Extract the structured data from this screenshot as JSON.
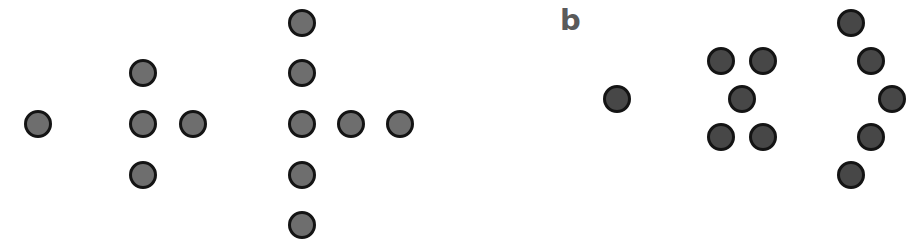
{
  "figure": {
    "panels": [
      {
        "id": "a",
        "label": "a",
        "label_visible": false,
        "dot_fill": "#6e6e6e",
        "dot_border": "#141414",
        "groups": [
          {
            "name": "group-1-dot",
            "count": 1,
            "dots": [
              [
                38,
                124
              ]
            ]
          },
          {
            "name": "group-4-dots",
            "count": 4,
            "dots": [
              [
                143,
                73
              ],
              [
                143,
                124
              ],
              [
                193,
                124
              ],
              [
                143,
                175
              ]
            ]
          },
          {
            "name": "group-7-dots",
            "count": 7,
            "dots": [
              [
                302,
                23
              ],
              [
                302,
                73
              ],
              [
                302,
                124
              ],
              [
                351,
                124
              ],
              [
                400,
                124
              ],
              [
                302,
                175
              ],
              [
                302,
                225
              ]
            ]
          }
        ]
      },
      {
        "id": "b",
        "label": "b",
        "label_visible": true,
        "dot_fill": "#474747",
        "dot_border": "#141414",
        "groups": [
          {
            "name": "group-1-dot",
            "count": 1,
            "dots": [
              [
                617,
                99
              ]
            ]
          },
          {
            "name": "group-5-dots",
            "count": 5,
            "dots": [
              [
                721,
                61
              ],
              [
                763,
                61
              ],
              [
                742,
                99
              ],
              [
                721,
                137
              ],
              [
                763,
                137
              ]
            ]
          },
          {
            "name": "group-arc-dots",
            "count": 5,
            "dots": [
              [
                851,
                23
              ],
              [
                871,
                61
              ],
              [
                892,
                99
              ],
              [
                871,
                137
              ],
              [
                851,
                175
              ]
            ]
          }
        ]
      }
    ]
  }
}
